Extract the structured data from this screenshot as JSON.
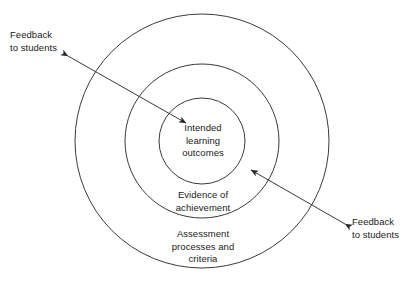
{
  "diagram": {
    "background_color": "#ffffff",
    "stroke_color": "#3a3a3a",
    "text_color": "#1a1a1a",
    "rings": [
      {
        "id": "outer",
        "label": "Assessment\nprocesses and\ncriteria",
        "center_x": 202,
        "center_y": 141,
        "radius": 127
      },
      {
        "id": "middle",
        "label": "Evidence of\nachievement",
        "center_x": 202,
        "center_y": 141,
        "radius": 77
      },
      {
        "id": "inner",
        "label": "Intended\nlearning\noutcomes",
        "center_x": 202,
        "center_y": 141,
        "radius": 43
      }
    ],
    "connectors": [
      {
        "id": "feedback-topleft",
        "label": "Feedback\nto students",
        "from_x": 68,
        "from_y": 56,
        "to_x": 186,
        "to_y": 123,
        "double_headed": true
      },
      {
        "id": "feedback-bottomright",
        "label": "Feedback\nto students",
        "from_x": 345,
        "from_y": 224,
        "to_x": 251,
        "to_y": 170,
        "double_headed": true
      }
    ]
  }
}
